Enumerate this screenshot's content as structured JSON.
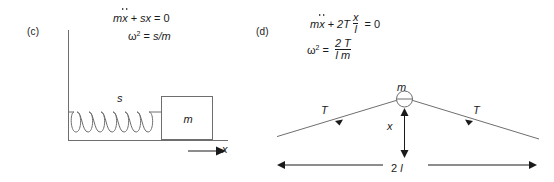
{
  "figure": {
    "background": "#ffffff",
    "stroke_color": "#6e6e6e",
    "text_color": "#1a1a1a"
  },
  "panels": [
    {
      "id": "c",
      "label": "(c)",
      "equations": [
        {
          "id": "c-eq1",
          "text": "mï¿½ + sx = 0",
          "parts": {
            "m": "m",
            "x_ddot": "x",
            "plus": "+",
            "s": "s",
            "x": "x",
            "equals": "=",
            "zero": "0"
          }
        },
        {
          "id": "c-eq2",
          "text": "ω² = s/m",
          "parts": {
            "omega": "ω",
            "exponent": "2",
            "equals": "=",
            "rhs": "s/m"
          }
        }
      ],
      "diagram": {
        "type": "mass-spring-on-floor",
        "spring_label": "s",
        "spring_coils": 7,
        "mass_label": "m",
        "displacement_label": "x",
        "wall": true,
        "floor": true
      }
    },
    {
      "id": "d",
      "label": "(d)",
      "equations": [
        {
          "id": "d-eq1",
          "text": "mẍ + 2T x/l = 0",
          "parts": {
            "m": "m",
            "x_ddot": "x",
            "plus": "+",
            "two_T": "2T",
            "frac_num": "x",
            "frac_den": "l",
            "equals": "=",
            "zero": "0"
          }
        },
        {
          "id": "d-eq2",
          "text": "ω² = 2T / l m",
          "parts": {
            "omega": "ω",
            "exponent": "2",
            "equals": "=",
            "frac_num": "2 T",
            "frac_den": "l m"
          }
        }
      ],
      "diagram": {
        "type": "mass-on-stretched-string",
        "mass_label": "m",
        "tension_label_left": "T",
        "tension_label_right": "T",
        "displacement_label": "x",
        "length_label_prefix": "2",
        "length_label_symbol": "l"
      }
    }
  ]
}
